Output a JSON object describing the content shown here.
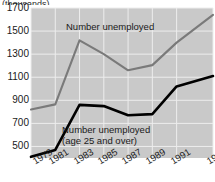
{
  "title_sliver": "(thousands)",
  "axis": {
    "y_ticks": [
      "1700",
      "1500",
      "1300",
      "1100",
      "900",
      "700",
      "500"
    ],
    "x_ticks": [
      "1979",
      "1981",
      "1983",
      "1985",
      "1987",
      "1989",
      "1991",
      "1994"
    ]
  },
  "annotations": {
    "total_line_1": "Number unemployed",
    "over25_line_1": "Number unemployed",
    "over25_line_2": "(age 25 and over)"
  },
  "colors": {
    "plot_background": "#c9c9c9",
    "gridline": "#ededed",
    "total_series": "#7a7a7a",
    "over25_series": "#000000",
    "text": "#1a1a1a",
    "page_background": "#ffffff"
  },
  "chart_data": {
    "type": "line",
    "title": "(thousands)",
    "xlabel": "",
    "ylabel": "",
    "ylim": [
      400,
      1700
    ],
    "xlim": [
      1979,
      1994
    ],
    "grid": true,
    "legend": "inline-annotations",
    "x": [
      1979,
      1981,
      1983,
      1985,
      1987,
      1989,
      1991,
      1994
    ],
    "series": [
      {
        "name": "Number unemployed",
        "color": "#7a7a7a",
        "values": [
          820,
          865,
          1420,
          1300,
          1160,
          1205,
          1400,
          1640
        ]
      },
      {
        "name": "Number unemployed (age 25 and over)",
        "color": "#000000",
        "values": [
          410,
          470,
          860,
          850,
          770,
          780,
          1020,
          1110
        ]
      }
    ]
  }
}
